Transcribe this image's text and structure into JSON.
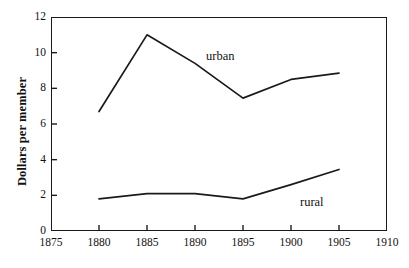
{
  "chart_data": {
    "type": "line",
    "title": "",
    "subtitle": "",
    "xlabel": "",
    "ylabel": "Dollars per member",
    "xlim": [
      1875,
      1910
    ],
    "ylim": [
      0,
      12
    ],
    "xticks": [
      1875,
      1880,
      1885,
      1890,
      1895,
      1900,
      1905,
      1910
    ],
    "yticks": [
      0,
      2,
      4,
      6,
      8,
      10,
      12
    ],
    "xtick_labels": [
      "1875",
      "1880",
      "1885",
      "1890",
      "1895",
      "1900",
      "1905",
      "1910"
    ],
    "ytick_labels": [
      "0",
      "2",
      "4",
      "6",
      "8",
      "10",
      "12"
    ],
    "grid": false,
    "legend_position": "inline-annotation",
    "x": [
      1880,
      1885,
      1890,
      1895,
      1900,
      1905
    ],
    "series": [
      {
        "name": "urban",
        "label": "urban",
        "color": "#1a1a1a",
        "values": [
          6.7,
          11.0,
          9.4,
          7.45,
          8.5,
          8.85
        ]
      },
      {
        "name": "rural",
        "label": "rural",
        "color": "#1a1a1a",
        "values": [
          1.8,
          2.1,
          2.1,
          1.8,
          2.6,
          3.45
        ]
      }
    ],
    "annotations": [
      {
        "text": "urban",
        "x": 1891.5,
        "y": 10.0
      },
      {
        "text": "rural",
        "x": 1901.5,
        "y": 2.35
      }
    ]
  },
  "axes": {
    "y_title": "Dollars per member"
  },
  "style": {
    "frame_color": "#1a1a1a",
    "line_color": "#1a1a1a",
    "background": "#ffffff"
  }
}
